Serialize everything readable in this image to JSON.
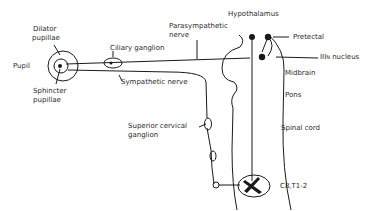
{
  "diagram": {
    "type": "pupillary light reflex pathway (autonomic innervation of the pupil)",
    "labels": {
      "pupil": "Pupil",
      "dilator_line1": "Dilator",
      "dilator_line2": "pupillae",
      "sphincter_line1": "Sphincter",
      "sphincter_line2": "pupillae",
      "ciliary_ganglion": "Ciliary ganglion",
      "sympathetic_nerve": "Sympathetic nerve",
      "parasympathetic_line1": "Parasympathetic",
      "parasympathetic_line2": "nerve",
      "hypothalamus": "Hypothalamus",
      "pretectal": "Pretectal",
      "third_nucleus_roman": "III",
      "third_nucleus_sup": "N",
      "third_nucleus_word": "nucleus",
      "midbrain": "Midbrain",
      "pons": "Pons",
      "superior_cervical_line1": "Superior cervical",
      "superior_cervical_line2": "ganglion",
      "spinal_cord": "Spinal cord",
      "segment": "C8,T1-2"
    },
    "colors": {
      "line": "#1a1a1a",
      "text": "#2a2a2a",
      "background": "#ffffff"
    }
  }
}
